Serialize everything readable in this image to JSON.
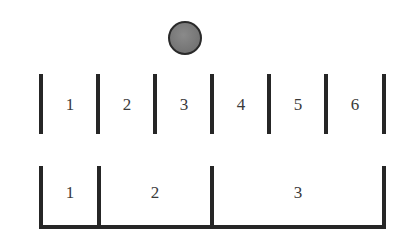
{
  "diagram": {
    "ball": {
      "cx": 185,
      "cy": 38,
      "radius": 17,
      "fill": "#777777",
      "stroke": "#2a2a2a"
    },
    "top_row": {
      "bar_top": 74,
      "bar_bottom": 134,
      "bar_x": [
        41,
        98,
        155,
        212,
        269,
        326,
        384
      ],
      "label_y": 95,
      "slots": [
        {
          "label": "1",
          "center_x": 70
        },
        {
          "label": "2",
          "center_x": 127
        },
        {
          "label": "3",
          "center_x": 184
        },
        {
          "label": "4",
          "center_x": 241
        },
        {
          "label": "5",
          "center_x": 298
        },
        {
          "label": "6",
          "center_x": 355
        }
      ]
    },
    "bottom_row": {
      "bar_top": 166,
      "bar_bottom": 229,
      "base_y": 225,
      "bar_x": [
        41,
        99,
        212,
        384
      ],
      "label_y": 183,
      "slots": [
        {
          "label": "1",
          "center_x": 70
        },
        {
          "label": "2",
          "center_x": 155
        },
        {
          "label": "3",
          "center_x": 298
        }
      ]
    },
    "colors": {
      "line": "#262626",
      "text": "#3a3a3a",
      "background": "#ffffff"
    }
  }
}
